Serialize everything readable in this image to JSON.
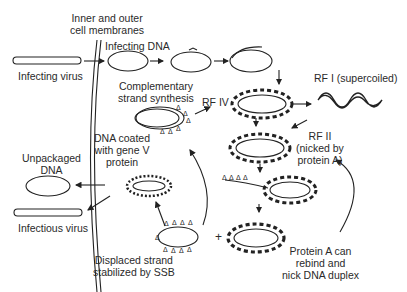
{
  "labels": {
    "membranes": [
      "Inner and outer",
      "cell membranes"
    ],
    "infecting_dna": "Infecting DNA",
    "infecting_virus": "Infecting virus",
    "complementary": [
      "Complementary",
      "strand synthesis"
    ],
    "rf4": "RF IV",
    "rf1": "RF I (supercoiled)",
    "rf2": [
      "RF II",
      "(nicked by",
      "protein A)"
    ],
    "dna_coated": [
      "DNA coated",
      "with gene V",
      "protein"
    ],
    "unpackaged": [
      "Unpackaged",
      "DNA"
    ],
    "infectious_virus": "Infectious virus",
    "displaced": [
      "Displaced strand",
      "stabilized by SSB"
    ],
    "plus": "+",
    "protein_a": [
      "Protein A can",
      "rebind and",
      "nick DNA duplex"
    ]
  }
}
